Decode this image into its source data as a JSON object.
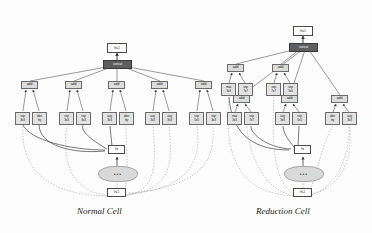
{
  "figure": {
    "type": "diagram",
    "captions": {
      "left": "Normal Cell",
      "right": "Reduction Cell"
    }
  },
  "labels": {
    "h_prev": "h",
    "h_prev_sub": "i-1",
    "h_cur": "h",
    "h_cur_sub": "i",
    "h_next": "h",
    "h_next_sub": "i+1",
    "concat": "concat",
    "add": "add",
    "dots": "•••"
  },
  "normal_cell": {
    "output": {
      "name": "h",
      "sub": "i+1"
    },
    "concat": "concat",
    "inputs": [
      {
        "name": "h",
        "sub": "i"
      },
      {
        "name": "h",
        "sub": "i-1"
      }
    ],
    "blocks": [
      {
        "combine": "add",
        "ops": [
          {
            "l1": "sep",
            "l2": "3x3"
          },
          {
            "l1": "iden",
            "l2": "tity"
          }
        ]
      },
      {
        "combine": "add",
        "ops": [
          {
            "l1": "sep",
            "l2": "3x3"
          },
          {
            "l1": "sep",
            "l2": "3x3"
          }
        ]
      },
      {
        "combine": "add",
        "ops": [
          {
            "l1": "avg",
            "l2": "3x3"
          },
          {
            "l1": "iden",
            "l2": "tity"
          }
        ]
      },
      {
        "combine": "add",
        "ops": [
          {
            "l1": "avg",
            "l2": "3x3"
          },
          {
            "l1": "avg",
            "l2": "3x3"
          }
        ]
      },
      {
        "combine": "add",
        "ops": [
          {
            "l1": "sep",
            "l2": "5x5"
          },
          {
            "l1": "sep",
            "l2": "3x3"
          }
        ]
      }
    ]
  },
  "reduction_cell": {
    "output": {
      "name": "h",
      "sub": "i+1"
    },
    "concat": "concat",
    "inputs": [
      {
        "name": "h",
        "sub": "i"
      },
      {
        "name": "h",
        "sub": "i-1"
      }
    ],
    "blocks": [
      {
        "combine": "add",
        "ops": [
          {
            "l1": "max",
            "l2": "3x3"
          },
          {
            "l1": "sep",
            "l2": "7x7"
          }
        ]
      },
      {
        "combine": "add",
        "ops": [
          {
            "l1": "sep",
            "l2": "7x7"
          },
          {
            "l1": "sep",
            "l2": "5x5"
          }
        ]
      },
      {
        "combine": "add",
        "ops": [
          {
            "l1": "max",
            "l2": "3x3"
          },
          {
            "l1": "sep",
            "l2": "7x7"
          }
        ]
      },
      {
        "combine": "add",
        "ops": [
          {
            "l1": "avg",
            "l2": "3x3"
          },
          {
            "l1": "sep",
            "l2": "5x5"
          }
        ]
      },
      {
        "combine": "add",
        "ops": [
          {
            "l1": "iden",
            "l2": "tity"
          },
          {
            "l1": "avg",
            "l2": "3x3"
          }
        ]
      }
    ]
  },
  "colors": {
    "node_fill": "#e2e2e2",
    "node_stroke": "#6a6a6a",
    "concat_fill": "#5e5e5e",
    "edge": "#6f6f6f",
    "edge_dashed": "#9a9a9a",
    "background": "#fdfdfd"
  }
}
